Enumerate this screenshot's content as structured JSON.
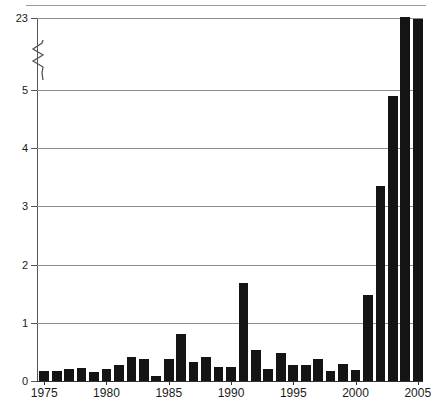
{
  "chart_data": {
    "type": "bar",
    "title": "",
    "subtitle": "",
    "xlabel": "",
    "ylabel": "",
    "grid": true,
    "legend": null,
    "axis_break": {
      "present": true,
      "between": [
        5,
        23
      ],
      "symbol": "zigzag"
    },
    "ylim": [
      0,
      23
    ],
    "y_ticks": [
      "0",
      "1",
      "2",
      "3",
      "4",
      "5",
      "23"
    ],
    "y_tick_values": [
      0,
      1,
      2,
      3,
      4,
      5,
      23
    ],
    "x_ticks": [
      "1975",
      "1980",
      "1985",
      "1990",
      "1995",
      "2000",
      "2005"
    ],
    "x_tick_values": [
      1975,
      1980,
      1985,
      1990,
      1995,
      2000,
      2005
    ],
    "xlim": [
      1974.5,
      2005.5
    ],
    "categories": [
      "1975",
      "1976",
      "1977",
      "1978",
      "1979",
      "1980",
      "1981",
      "1982",
      "1983",
      "1984",
      "1985",
      "1986",
      "1987",
      "1988",
      "1989",
      "1990",
      "1991",
      "1992",
      "1993",
      "1994",
      "1995",
      "1996",
      "1997",
      "1998",
      "1999",
      "2000",
      "2001",
      "2002",
      "2003",
      "2004",
      "2005"
    ],
    "values": [
      0.17,
      0.17,
      0.2,
      0.23,
      0.15,
      0.2,
      0.27,
      0.41,
      0.37,
      0.08,
      0.37,
      0.8,
      0.33,
      0.42,
      0.24,
      0.24,
      1.68,
      0.53,
      0.21,
      0.48,
      0.27,
      0.27,
      0.37,
      0.18,
      0.29,
      0.19,
      1.47,
      3.35,
      4.9,
      23.2,
      22.8
    ],
    "bar_color": "#141414",
    "grid_color": "#8d8d8d",
    "axis_color": "#333333"
  }
}
